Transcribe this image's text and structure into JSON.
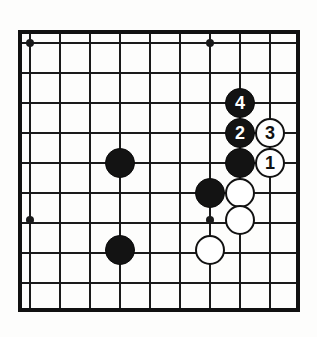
{
  "diagram": {
    "kind": "go-board-diagram",
    "board": {
      "edge_left": 20,
      "edge_top": 32,
      "edge_right": 298,
      "edge_bottom": 310,
      "cell_size": 30,
      "columns": 10,
      "rows": 10,
      "line_color": "#1a1a1a",
      "border_color": "#111111",
      "background_color": "#fdfdfc",
      "line_width": 2,
      "border_width": 4
    },
    "star_points": [
      {
        "name": "star-top-left",
        "x": 30,
        "y": 43
      },
      {
        "name": "star-top-right",
        "x": 210,
        "y": 43
      },
      {
        "name": "star-bottom-left",
        "x": 30,
        "y": 220
      },
      {
        "name": "star-bottom-right",
        "x": 210,
        "y": 220
      }
    ],
    "colors": {
      "black_stone": "#131313",
      "white_stone": "#ffffff",
      "black_label": "#ffffff",
      "white_label": "#111111"
    },
    "stones": [
      {
        "name": "black-stone-left-upper",
        "color": "black",
        "label": "",
        "x": 120,
        "y": 163,
        "r": 15
      },
      {
        "name": "black-stone-left-lower",
        "color": "black",
        "label": "",
        "x": 120,
        "y": 250,
        "r": 15
      },
      {
        "name": "black-stone-move-4",
        "color": "black",
        "label": "4",
        "x": 240,
        "y": 103,
        "r": 15
      },
      {
        "name": "black-stone-move-2",
        "color": "black",
        "label": "2",
        "x": 240,
        "y": 133,
        "r": 15
      },
      {
        "name": "white-stone-move-3",
        "color": "white",
        "label": "3",
        "x": 270,
        "y": 133,
        "r": 15
      },
      {
        "name": "black-stone-right-middle",
        "color": "black",
        "label": "",
        "x": 240,
        "y": 163,
        "r": 15
      },
      {
        "name": "white-stone-move-1",
        "color": "white",
        "label": "1",
        "x": 270,
        "y": 163,
        "r": 15
      },
      {
        "name": "black-stone-center",
        "color": "black",
        "label": "",
        "x": 210,
        "y": 193,
        "r": 15
      },
      {
        "name": "white-stone-upper",
        "color": "white",
        "label": "",
        "x": 240,
        "y": 193,
        "r": 15
      },
      {
        "name": "white-stone-middle",
        "color": "white",
        "label": "",
        "x": 240,
        "y": 220,
        "r": 15
      },
      {
        "name": "white-stone-lower",
        "color": "white",
        "label": "",
        "x": 210,
        "y": 250,
        "r": 15
      }
    ],
    "move_sequence": [
      {
        "move": "1",
        "color": "white"
      },
      {
        "move": "2",
        "color": "black"
      },
      {
        "move": "3",
        "color": "white"
      },
      {
        "move": "4",
        "color": "black"
      }
    ]
  }
}
